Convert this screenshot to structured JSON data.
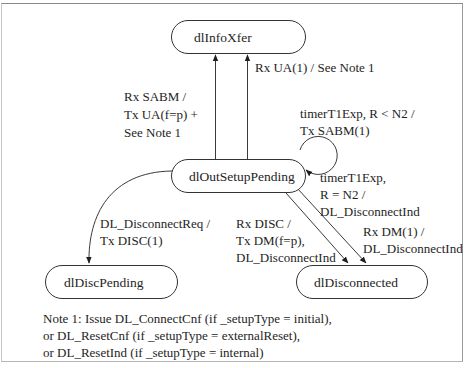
{
  "diagram": {
    "type": "state-machine",
    "states": [
      {
        "id": "dlInfoXfer",
        "label": "dlInfoXfer"
      },
      {
        "id": "dlOutSetupPending",
        "label": "dlOutSetupPending"
      },
      {
        "id": "dlDiscPending",
        "label": "dlDiscPending"
      },
      {
        "id": "dlDisconnected",
        "label": "dlDisconnected"
      }
    ],
    "transitions": [
      {
        "id": "rx-sabm",
        "from": "dlOutSetupPending",
        "to": "dlInfoXfer",
        "label_lines": [
          "Rx SABM /",
          "Tx UA(f=p) +",
          "See Note 1"
        ]
      },
      {
        "id": "rx-ua",
        "from": "dlOutSetupPending",
        "to": "dlInfoXfer",
        "label_lines": [
          "Rx UA(1) / See Note 1"
        ]
      },
      {
        "id": "timer-retry",
        "from": "dlOutSetupPending",
        "to": "dlOutSetupPending",
        "label_lines": [
          "timerT1Exp, R < N2 /",
          "Tx SABM(1)"
        ]
      },
      {
        "id": "timer-expire",
        "from": "dlOutSetupPending",
        "to": "dlDisconnected",
        "label_lines": [
          "timerT1Exp,",
          "R = N2 /",
          "DL_DisconnectInd"
        ]
      },
      {
        "id": "disconnect-req",
        "from": "dlOutSetupPending",
        "to": "dlDiscPending",
        "label_lines": [
          "DL_DisconnectReq /",
          "Tx DISC(1)"
        ]
      },
      {
        "id": "rx-disc",
        "from": "dlOutSetupPending",
        "to": "dlDisconnected",
        "label_lines": [
          "Rx DISC /",
          "Tx DM(f=p),",
          "DL_DisconnectInd"
        ]
      },
      {
        "id": "rx-dm",
        "from": "dlOutSetupPending",
        "to": "dlDisconnected",
        "label_lines": [
          "Rx DM(1) /",
          "DL_DisconnectInd"
        ]
      }
    ],
    "note": {
      "lines": [
        "Note 1: Issue DL_ConnectCnf (if _setupType = initial),",
        "or DL_ResetCnf (if _setupType = externalReset),",
        "or DL_ResetInd (if _setupType = internal)"
      ]
    }
  }
}
